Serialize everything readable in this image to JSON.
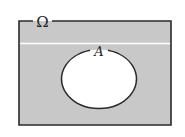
{
  "diagram": {
    "type": "venn",
    "universe_label": "Ω",
    "set_label": "A",
    "shaded_region": "complement of A",
    "colors": {
      "shade": "#c8c8c8",
      "stroke": "#2a2a2a",
      "background": "#ffffff"
    }
  }
}
